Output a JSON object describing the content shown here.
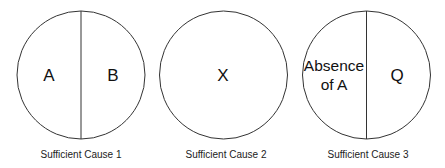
{
  "diagram": {
    "type": "sufficient-cause pie model",
    "causes": [
      {
        "label": "Sufficient Cause 1",
        "components": [
          "A",
          "B"
        ]
      },
      {
        "label": "Sufficient Cause 2",
        "components": [
          "X"
        ]
      },
      {
        "label": "Sufficient Cause 3",
        "components": [
          "Absence of A",
          "Q"
        ],
        "component_lines": [
          [
            "Absence",
            "of A"
          ],
          [
            "Q"
          ]
        ]
      }
    ],
    "colors": {
      "stroke": "#333333",
      "background": "#ffffff",
      "text": "#111111"
    }
  }
}
